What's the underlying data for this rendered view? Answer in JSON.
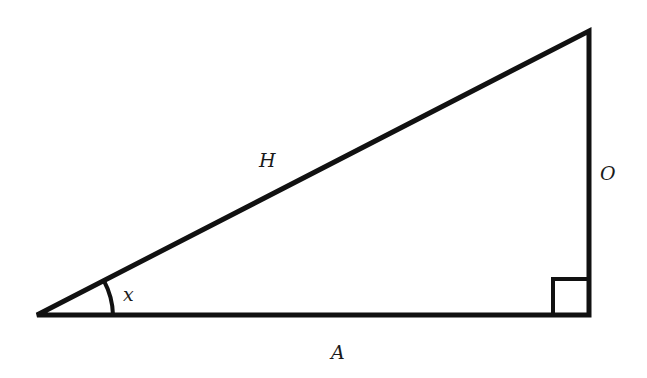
{
  "diagram": {
    "type": "right-triangle",
    "labels": {
      "hypotenuse": "H",
      "opposite": "O",
      "adjacent": "A",
      "angle": "x"
    },
    "colors": {
      "stroke": "#111111",
      "background": "#ffffff"
    }
  }
}
